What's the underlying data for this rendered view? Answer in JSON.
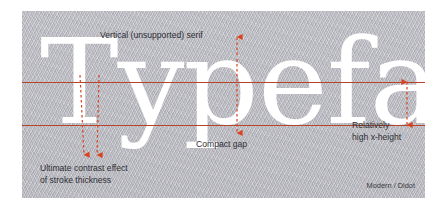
{
  "figure": {
    "kind": "typography-anatomy-diagram",
    "specimen_word": "Typeface",
    "caption": "Modern / Didot",
    "colors": {
      "panel_background": "#b9bac0",
      "specimen_text": "#ffffff",
      "guide_line": "#b4442a",
      "arrow": "#d8421f",
      "annotation_text": "#2e2e33",
      "page_background": "#ffffff"
    }
  },
  "guides": [
    {
      "name": "x-height-line",
      "y": 71
    },
    {
      "name": "baseline",
      "y": 114
    }
  ],
  "annotations": [
    {
      "id": "vertical-serif",
      "lines": [
        "Vertical (unsupported) serif"
      ],
      "arrow": "up",
      "target": "serif of the letter f"
    },
    {
      "id": "stroke-contrast",
      "lines": [
        "Ultimate contrast effect",
        "of stroke thickness"
      ],
      "arrow": "down-double",
      "target": "thin and thick strokes of the letter y"
    },
    {
      "id": "compact-gap",
      "lines": [
        "Compact gap"
      ],
      "arrow": "down",
      "target": "gap between e and f"
    },
    {
      "id": "x-height",
      "lines": [
        "Relatively",
        "high x-height"
      ],
      "arrow": "vertical-double",
      "target": "distance between baseline and x-height line"
    }
  ]
}
